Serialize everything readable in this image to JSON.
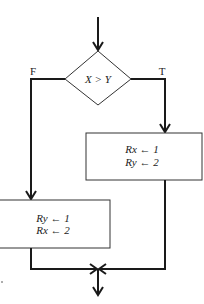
{
  "flowchart": {
    "decision": {
      "label": "X > Y"
    },
    "branches": {
      "false_label": "F",
      "true_label": "T"
    },
    "true_box": {
      "line1": "Rx ← 1",
      "line2": "Ry ← 2"
    },
    "false_box": {
      "line1": "Ry ← 1",
      "line2": "Rx ← 2"
    }
  },
  "colors": {
    "line": "#1a1a1a",
    "box_border": "#333333",
    "background": "#ffffff"
  }
}
